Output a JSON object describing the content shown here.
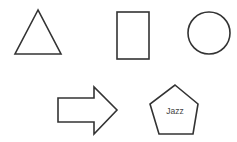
{
  "diagram": {
    "background": "#ffffff",
    "stroke_color": "#333333",
    "shapes": [
      {
        "id": "triangle",
        "type": "triangle",
        "label": ""
      },
      {
        "id": "rectangle",
        "type": "rectangle",
        "label": ""
      },
      {
        "id": "circle",
        "type": "circle",
        "label": ""
      },
      {
        "id": "arrow",
        "type": "right-arrow",
        "label": ""
      },
      {
        "id": "pentagon",
        "type": "pentagon",
        "label": "Jazz"
      }
    ]
  }
}
